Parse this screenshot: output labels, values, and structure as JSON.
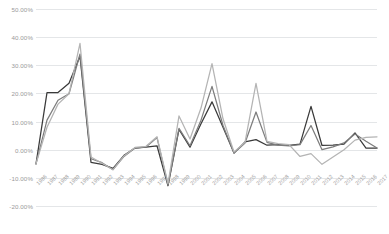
{
  "chart_data": {
    "type": "line",
    "title": "",
    "xlabel": "",
    "ylabel": "",
    "ylim": [
      -20,
      50
    ],
    "ytick_values": [
      50,
      40,
      30,
      20,
      10,
      0,
      -10,
      -20
    ],
    "ytick_labels": [
      "50.00%",
      "40.00%",
      "30.00%",
      "20.00%",
      "10.00%",
      "0.00%",
      "-10.00%",
      "-20.00%"
    ],
    "grid": true,
    "legend": "none",
    "categories": [
      "1986",
      "1987",
      "1988",
      "1989",
      "1990",
      "1991",
      "1992",
      "1993",
      "1994",
      "1995",
      "1996",
      "1997",
      "1998",
      "1999",
      "2000",
      "2001",
      "2002",
      "2003",
      "2004",
      "2005",
      "2006",
      "2007",
      "2008",
      "2009",
      "2010",
      "2011",
      "2012",
      "2013",
      "2014",
      "2015",
      "2016",
      "2017"
    ],
    "series": [
      {
        "name": "Series 1",
        "color": "#3a3a3a",
        "values": [
          -5.0,
          20.3,
          20.3,
          23.6,
          33.2,
          -4.5,
          -5.2,
          -6.6,
          -2.0,
          0.6,
          0.9,
          1.4,
          -12.8,
          7.2,
          0.9,
          9.2,
          17.0,
          8.0,
          -1.2,
          2.8,
          3.6,
          1.6,
          1.8,
          1.5,
          2.0,
          15.4,
          1.5,
          1.6,
          2.0,
          6.0,
          0.6,
          0.6
        ]
      },
      {
        "name": "Series 2",
        "color": "#7d7d7d",
        "values": [
          -5.0,
          10.5,
          17.6,
          19.9,
          34.0,
          -3.2,
          -4.6,
          -7.1,
          -2.4,
          0.6,
          1.0,
          4.3,
          -12.6,
          7.6,
          1.4,
          10.5,
          22.5,
          8.6,
          -1.2,
          2.4,
          13.4,
          2.6,
          1.6,
          1.4,
          1.8,
          8.6,
          0.0,
          1.0,
          2.4,
          5.6,
          3.0,
          0.6
        ]
      },
      {
        "name": "Series 3",
        "color": "#b4b4b4",
        "values": [
          -5.0,
          8.0,
          16.2,
          19.9,
          37.8,
          -2.6,
          -4.8,
          -7.1,
          -2.2,
          0.8,
          1.2,
          4.6,
          -12.0,
          12.0,
          3.8,
          14.8,
          30.6,
          11.0,
          -0.8,
          2.6,
          23.6,
          3.0,
          2.2,
          1.8,
          -2.4,
          -1.4,
          -5.2,
          -2.6,
          0.0,
          3.4,
          4.4,
          4.6
        ]
      }
    ]
  }
}
